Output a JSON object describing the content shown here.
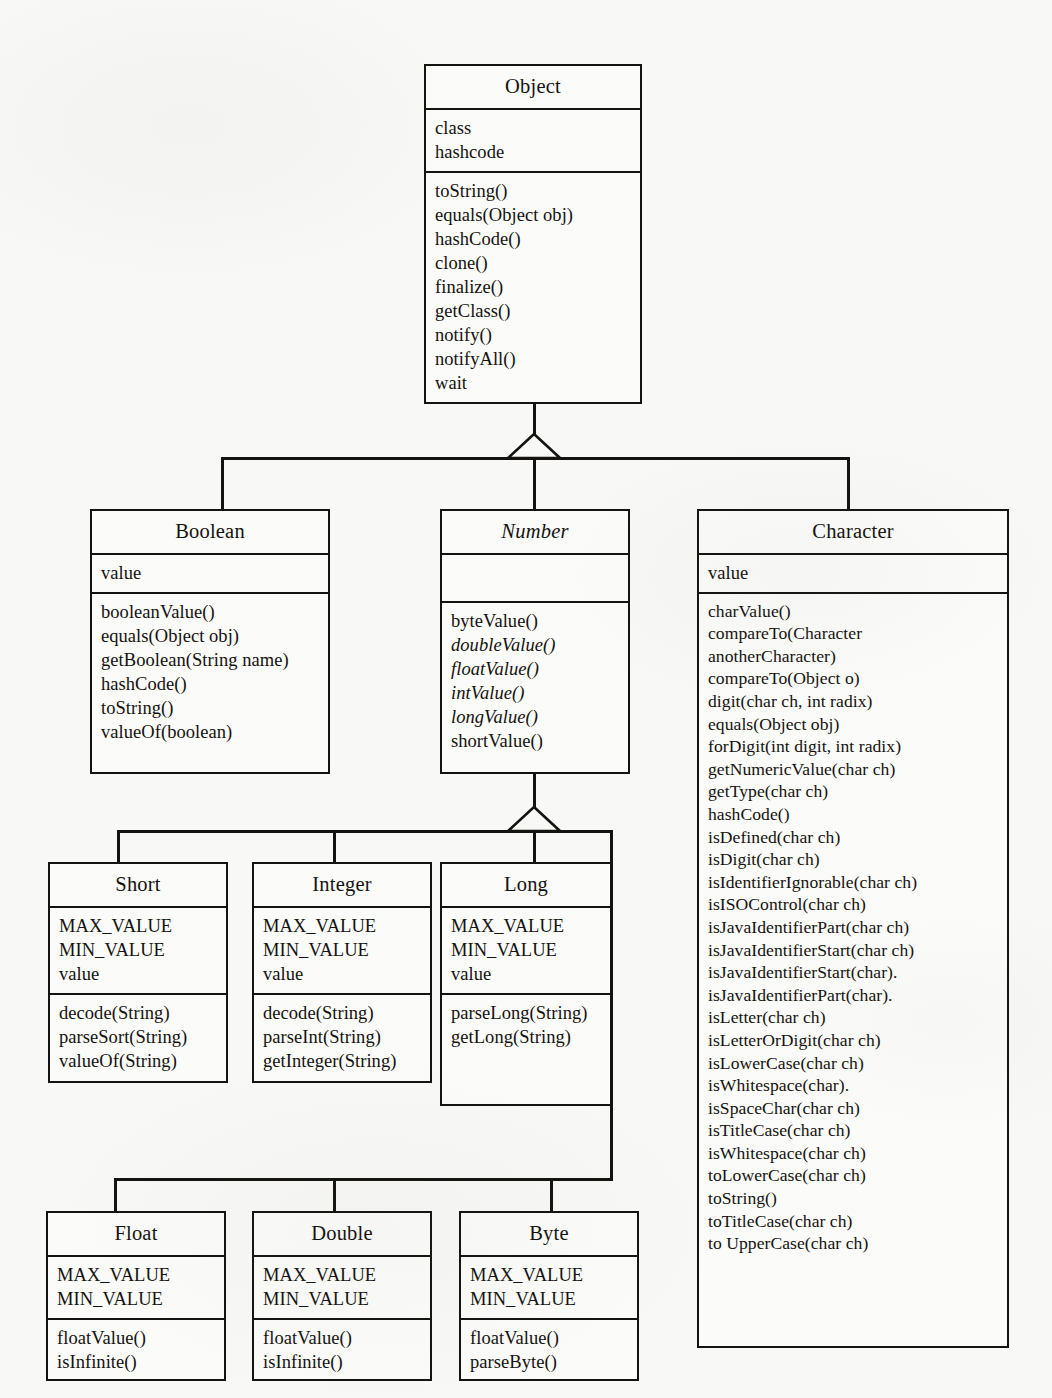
{
  "diagram": {
    "ink_color": "#15130f",
    "paper_color": "#f8f8f6"
  },
  "classes": {
    "object": {
      "name": "Object",
      "abstract": false,
      "attributes": [
        "class",
        "hashcode"
      ],
      "methods": [
        "toString()",
        "equals(Object obj)",
        "hashCode()",
        "clone()",
        "finalize()",
        "getClass()",
        "notify()",
        "notifyAll()",
        "wait"
      ]
    },
    "boolean": {
      "name": "Boolean",
      "abstract": false,
      "attributes": [
        "value"
      ],
      "methods": [
        "booleanValue()",
        "equals(Object obj)",
        "getBoolean(String name)",
        "hashCode()",
        "toString()",
        "valueOf(boolean)"
      ]
    },
    "number": {
      "name": "Number",
      "abstract": true,
      "attributes": [],
      "methods": [
        "byteValue()",
        "doubleValue()",
        "floatValue()",
        "intValue()",
        "longValue()",
        "shortValue()"
      ],
      "abstract_methods": [
        "doubleValue()",
        "floatValue()",
        "intValue()",
        "longValue()"
      ]
    },
    "character": {
      "name": "Character",
      "abstract": false,
      "attributes": [
        "value"
      ],
      "methods": [
        "charValue()",
        "compareTo(Character",
        "anotherCharacter)",
        "compareTo(Object o)",
        "digit(char ch, int radix)",
        "equals(Object obj)",
        "forDigit(int digit, int radix)",
        "getNumericValue(char ch)",
        "getType(char ch)",
        "hashCode()",
        "isDefined(char ch)",
        "isDigit(char ch)",
        "isIdentifierIgnorable(char ch)",
        "isISOControl(char ch)",
        "isJavaIdentifierPart(char ch)",
        "isJavaIdentifierStart(char ch)",
        "isJavaIdentifierStart(char).",
        "isJavaIdentifierPart(char).",
        "isLetter(char ch)",
        "isLetterOrDigit(char ch)",
        "isLowerCase(char ch)",
        "isWhitespace(char).",
        "isSpaceChar(char ch)",
        "isTitleCase(char ch)",
        "isWhitespace(char ch)",
        "toLowerCase(char ch)",
        "toString()",
        "toTitleCase(char ch)",
        "to UpperCase(char ch)"
      ]
    },
    "short": {
      "name": "Short",
      "abstract": false,
      "attributes": [
        "MAX_VALUE",
        "MIN_VALUE",
        "value"
      ],
      "methods": [
        "decode(String)",
        "parseSort(String)",
        "valueOf(String)"
      ]
    },
    "integer": {
      "name": "Integer",
      "abstract": false,
      "attributes": [
        "MAX_VALUE",
        "MIN_VALUE",
        "value"
      ],
      "methods": [
        "decode(String)",
        "parseInt(String)",
        "getInteger(String)"
      ]
    },
    "long": {
      "name": "Long",
      "abstract": false,
      "attributes": [
        "MAX_VALUE",
        "MIN_VALUE",
        "value"
      ],
      "methods": [
        "parseLong(String)",
        "getLong(String)"
      ]
    },
    "float": {
      "name": "Float",
      "abstract": false,
      "attributes": [
        "MAX_VALUE",
        "MIN_VALUE"
      ],
      "methods": [
        "floatValue()",
        "isInfinite()"
      ]
    },
    "double": {
      "name": "Double",
      "abstract": false,
      "attributes": [
        "MAX_VALUE",
        "MIN_VALUE"
      ],
      "methods": [
        "floatValue()",
        "isInfinite()"
      ]
    },
    "byte": {
      "name": "Byte",
      "abstract": false,
      "attributes": [
        "MAX_VALUE",
        "MIN_VALUE"
      ],
      "methods": [
        "floatValue()",
        "parseByte()"
      ]
    }
  },
  "relationships": [
    {
      "type": "generalization",
      "parent": "Object",
      "children": [
        "Boolean",
        "Number",
        "Character"
      ]
    },
    {
      "type": "generalization",
      "parent": "Number",
      "children": [
        "Short",
        "Integer",
        "Long",
        "Float",
        "Double",
        "Byte"
      ]
    }
  ]
}
